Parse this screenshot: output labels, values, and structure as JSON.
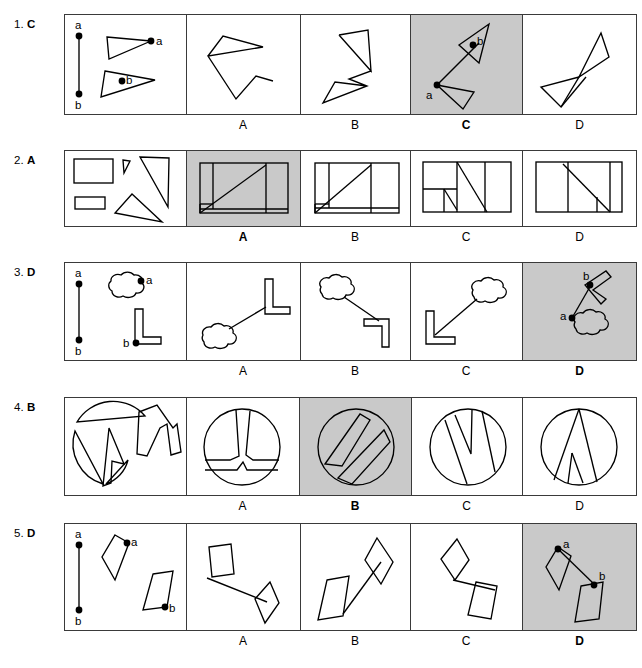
{
  "page": {
    "background_color": "#ffffff",
    "line_color": "#000000",
    "shaded_answer_color": "#c9c9c9",
    "panel_border_color": "#3a3a3a"
  },
  "layout": {
    "panel_left": 64,
    "panel_right": 637,
    "dividers": [
      64,
      186,
      300,
      410,
      522,
      637
    ],
    "option_labels": [
      "A",
      "B",
      "C",
      "D"
    ]
  },
  "rows": [
    {
      "number": "1.",
      "answer": "C",
      "correct_option": "C",
      "stimulus_point_labels": [
        "a",
        "b"
      ],
      "object_point_labels": [
        "a",
        "b"
      ],
      "shape_kind": "triangles",
      "options": [
        {
          "letter": "A",
          "shaded": false
        },
        {
          "letter": "B",
          "shaded": false
        },
        {
          "letter": "C",
          "shaded": true,
          "point_labels": [
            "a",
            "b"
          ]
        },
        {
          "letter": "D",
          "shaded": false
        }
      ]
    },
    {
      "number": "2.",
      "answer": "A",
      "correct_option": "A",
      "stimulus_point_labels": [],
      "object_point_labels": [],
      "shape_kind": "rectangles-and-triangles",
      "options": [
        {
          "letter": "A",
          "shaded": true
        },
        {
          "letter": "B",
          "shaded": false
        },
        {
          "letter": "C",
          "shaded": false
        },
        {
          "letter": "D",
          "shaded": false
        }
      ]
    },
    {
      "number": "3.",
      "answer": "D",
      "correct_option": "D",
      "stimulus_point_labels": [
        "a",
        "b"
      ],
      "object_point_labels": [
        "a",
        "b"
      ],
      "shape_kind": "cloud-and-L-bar",
      "options": [
        {
          "letter": "A",
          "shaded": false
        },
        {
          "letter": "B",
          "shaded": false
        },
        {
          "letter": "C",
          "shaded": false
        },
        {
          "letter": "D",
          "shaded": true,
          "point_labels": [
            "a",
            "b"
          ]
        }
      ]
    },
    {
      "number": "4.",
      "answer": "B",
      "correct_option": "B",
      "stimulus_point_labels": [],
      "object_point_labels": [],
      "shape_kind": "circle-pieces",
      "options": [
        {
          "letter": "A",
          "shaded": false
        },
        {
          "letter": "B",
          "shaded": true
        },
        {
          "letter": "C",
          "shaded": false
        },
        {
          "letter": "D",
          "shaded": false
        }
      ]
    },
    {
      "number": "5.",
      "answer": "D",
      "correct_option": "D",
      "stimulus_point_labels": [
        "a",
        "b"
      ],
      "object_point_labels": [
        "a",
        "b"
      ],
      "shape_kind": "diamond-and-parallelogram",
      "options": [
        {
          "letter": "A",
          "shaded": false
        },
        {
          "letter": "B",
          "shaded": false
        },
        {
          "letter": "C",
          "shaded": false
        },
        {
          "letter": "D",
          "shaded": true,
          "point_labels": [
            "a",
            "b"
          ]
        }
      ]
    }
  ]
}
